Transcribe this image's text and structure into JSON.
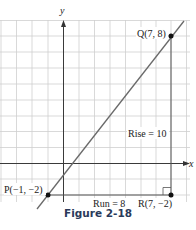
{
  "figure": {
    "caption": "Figure 2-18",
    "axes": {
      "x_label": "x",
      "y_label": "y"
    },
    "points": {
      "P": {
        "label": "P(−1, −2)",
        "x": -1,
        "y": -2
      },
      "Q": {
        "label": "Q(7, 8)",
        "x": 7,
        "y": 8
      },
      "R": {
        "label": "R(7, −2)",
        "x": 7,
        "y": -2
      }
    },
    "annotations": {
      "rise": "Rise = 10",
      "run": "Run = 8"
    },
    "colors": {
      "grid": "#c8c8c8",
      "axis": "#333333",
      "line": "#6a6a6a",
      "caption": "#2a3a5a"
    }
  }
}
